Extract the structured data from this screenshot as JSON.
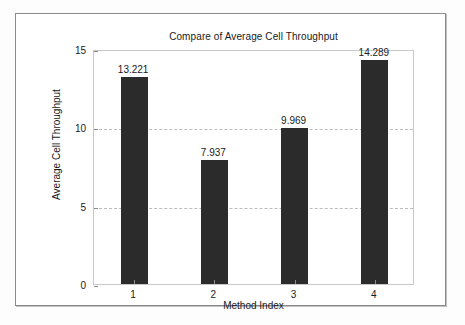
{
  "chart_data": {
    "type": "bar",
    "title": "Compare of Average Cell Throughput",
    "xlabel": "Method Index",
    "ylabel": "Average Cell Throughput",
    "categories": [
      "1",
      "2",
      "3",
      "4"
    ],
    "values": [
      13.221,
      7.937,
      9.969,
      14.289
    ],
    "value_labels": [
      "13.221",
      "7.937",
      "9.969",
      "14.289"
    ],
    "ylim": [
      0,
      15
    ],
    "yticks": [
      0,
      5,
      10,
      15
    ],
    "ytick_labels": [
      "0",
      "5",
      "10",
      "15"
    ],
    "xtick_labels": [
      "1",
      "2",
      "3",
      "4"
    ],
    "grid": "horizontal-dashed",
    "legend": null,
    "bar_color": "#2b2b2b",
    "grid_color": "#bdbdbd",
    "axis_color": "#8c8c8c",
    "background_color": "#ffffff"
  }
}
